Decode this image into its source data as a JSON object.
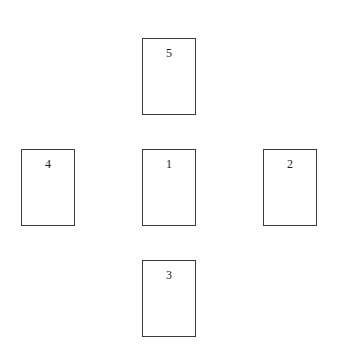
{
  "diagram": {
    "type": "card-layout",
    "positions": [
      {
        "label": "5",
        "slot": "top",
        "x": 142,
        "y": 38
      },
      {
        "label": "4",
        "slot": "left",
        "x": 21,
        "y": 149
      },
      {
        "label": "1",
        "slot": "center",
        "x": 142,
        "y": 149
      },
      {
        "label": "2",
        "slot": "right",
        "x": 263,
        "y": 149
      },
      {
        "label": "3",
        "slot": "bottom",
        "x": 142,
        "y": 260
      }
    ]
  }
}
